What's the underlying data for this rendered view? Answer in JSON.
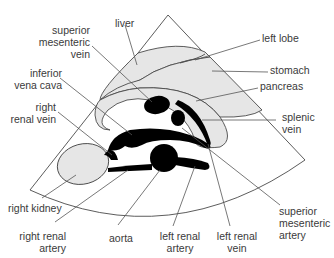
{
  "diagram": {
    "type": "anatomical ultrasound schematic (transverse upper abdomen)",
    "colors": {
      "outline": "#4a4a4a",
      "organ_fill": "#e6e6e6",
      "vessel_fill": "#000000",
      "leader_line": "#555555",
      "text": "#3a3a3a"
    },
    "labels": {
      "liver": "liver",
      "left_lobe": "left lobe",
      "superior_mesenteric_vein": "superior\nmesenteric\nvein",
      "stomach": "stomach",
      "inferior_vena_cava": "inferior\nvena cava",
      "pancreas": "pancreas",
      "right_renal_vein": "right\nrenal vein",
      "splenic_vein": "splenic\nvein",
      "right_kidney": "right kidney",
      "superior_mesenteric_artery": "superior\nmesenteric\nartery",
      "right_renal_artery": "right renal\nartery",
      "aorta": "aorta",
      "left_renal_artery": "left renal\nartery",
      "left_renal_vein": "left renal\nvein"
    }
  }
}
